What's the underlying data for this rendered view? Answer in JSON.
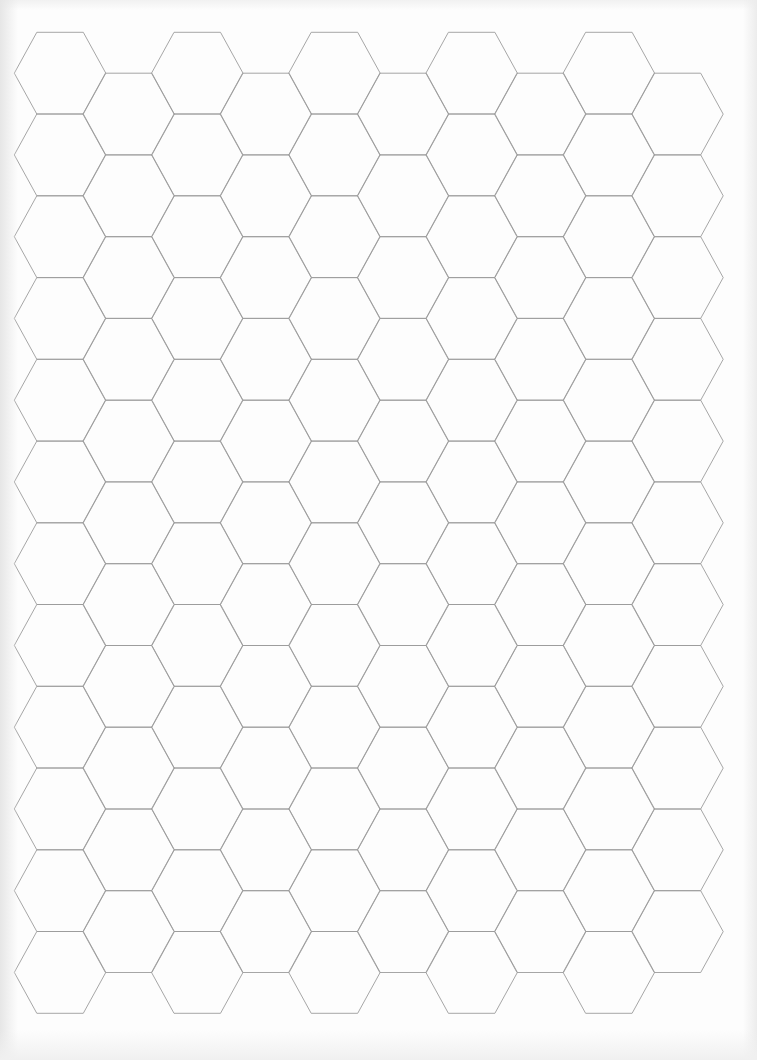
{
  "document": {
    "type": "hexagonal graph paper",
    "background_color": "#fdfdfd",
    "line_color": "#9c9c9c"
  },
  "hex_grid": {
    "orientation": "flat-top",
    "columns": 10,
    "rows_even_columns": 12,
    "rows_odd_columns": 11,
    "origin_x": 14.3,
    "origin_y_even": 32.3,
    "origin_y_odd": 73.2,
    "column_step": 68.6,
    "row_step": 81.75,
    "hex_width": 91.5,
    "hex_height": 81.75,
    "top_edge_inset": 22.5
  }
}
